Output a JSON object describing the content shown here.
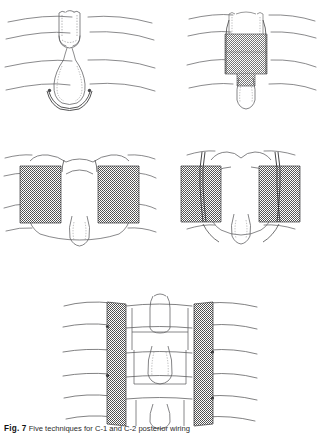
{
  "figure": {
    "number_label": "Fig. 7",
    "caption_text": "Five techniques for C-1 and C-2 posterior wiring",
    "background_color": "#ffffff",
    "ink_color": "#4a4a4a",
    "graft_dark_color": "#595959",
    "graft_mid_color": "#7d7d7d",
    "strut_dark_color": "#565656"
  },
  "panels": [
    {
      "id": "a",
      "position": "top-left",
      "name": "gallie-wiring-no-graft",
      "title": "",
      "graft_count": 0,
      "graft_shade": "",
      "wire_loops": 2,
      "lamina_lines": 4,
      "description": "Midline sublaminar wire loop around C-1 arch passed beneath C-2 spinous process"
    },
    {
      "id": "b",
      "position": "top-right",
      "name": "gallie-midline-onlay-graft",
      "title": "",
      "graft_count": 1,
      "graft_shade": "#7d7d7d",
      "wire_loops": 2,
      "lamina_lines": 4,
      "description": "Single midline corticocancellous onlay block graft wired to C-1 arch and C-2 spinous process"
    },
    {
      "id": "c",
      "position": "middle-left",
      "name": "brooks-bilateral-wedge-grafts",
      "title": "",
      "graft_count": 2,
      "graft_shade": "#595959",
      "wire_loops": 2,
      "lamina_lines": 4,
      "description": "Bilateral interlaminar wedge grafts seated between C-1 and C-2 laminae"
    },
    {
      "id": "d",
      "position": "middle-right",
      "name": "brooks-jenkins-bilateral-grafts-sublaminar-wires",
      "title": "",
      "graft_count": 2,
      "graft_shade": "#595959",
      "wire_loops": 2,
      "lamina_lines": 4,
      "description": "Bilateral wedge grafts compressed by doubled sublaminar wires at C-1 and C-2"
    },
    {
      "id": "e",
      "position": "bottom-center",
      "name": "bilateral-long-strut-grafts",
      "title": "",
      "graft_count": 2,
      "graft_shade": "#565656",
      "wire_loops": 3,
      "lamina_lines": 6,
      "description": "Long bilateral strut grafts spanning multiple levels secured by segmental wires"
    }
  ]
}
